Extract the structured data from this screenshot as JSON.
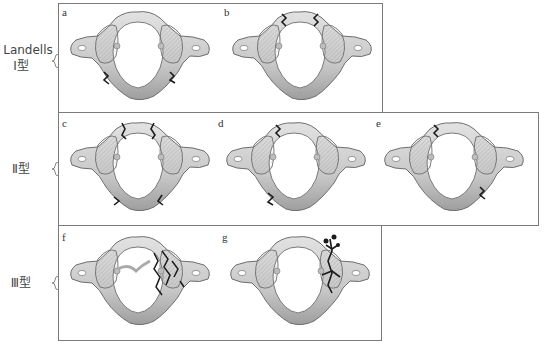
{
  "figure": {
    "rows": [
      {
        "id": "type1",
        "label_line1": "Landells",
        "label_line2": "Ⅰ型",
        "panels": [
          {
            "letter": "a",
            "fracture": "posterior arch bilateral"
          },
          {
            "letter": "b",
            "fracture": "anterior arch bilateral"
          }
        ]
      },
      {
        "id": "type2",
        "label_line1": "Ⅱ型",
        "panels": [
          {
            "letter": "c",
            "fracture": "anterior and posterior arch multiple"
          },
          {
            "letter": "d",
            "fracture": "anterior and posterior arch one side"
          },
          {
            "letter": "e",
            "fracture": "anterior one side, posterior other side"
          }
        ]
      },
      {
        "id": "type3",
        "label_line1": "Ⅲ型",
        "panels": [
          {
            "letter": "f",
            "fracture": "lateral mass comminuted"
          },
          {
            "letter": "g",
            "fracture": "lateral mass"
          }
        ]
      }
    ],
    "colors": {
      "border": "#7a7a7a",
      "bone_fill": "#d4d4d4",
      "bone_shade": "#a9a9a9",
      "bone_outline": "#6e6e6e",
      "fracture": "#1a1a1a",
      "label_text": "#444444"
    }
  }
}
